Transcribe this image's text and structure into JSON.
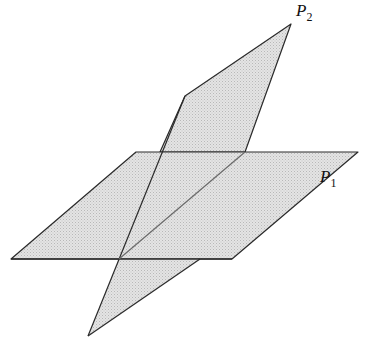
{
  "diagram": {
    "fill_color": "#dcdcdc",
    "stroke_color": "#2a2a2a",
    "planes": [
      {
        "id": "P1",
        "label": "P",
        "subscript": "1",
        "points": "11,259 136,152 358,152 232,259",
        "label_pos": [
          320,
          183
        ]
      },
      {
        "id": "P2",
        "label": "P",
        "subscript": "2",
        "points_back": "185,96 291,24 245,152 160,152",
        "points_front_upper": "119,259 160,152 245,152",
        "points_front_lower": "119,259 200,259 88,336",
        "label_pos": [
          303,
          19
        ]
      }
    ],
    "intersection_line": {
      "x1": 119,
      "y1": 259,
      "x2": 245,
      "y2": 152
    }
  }
}
